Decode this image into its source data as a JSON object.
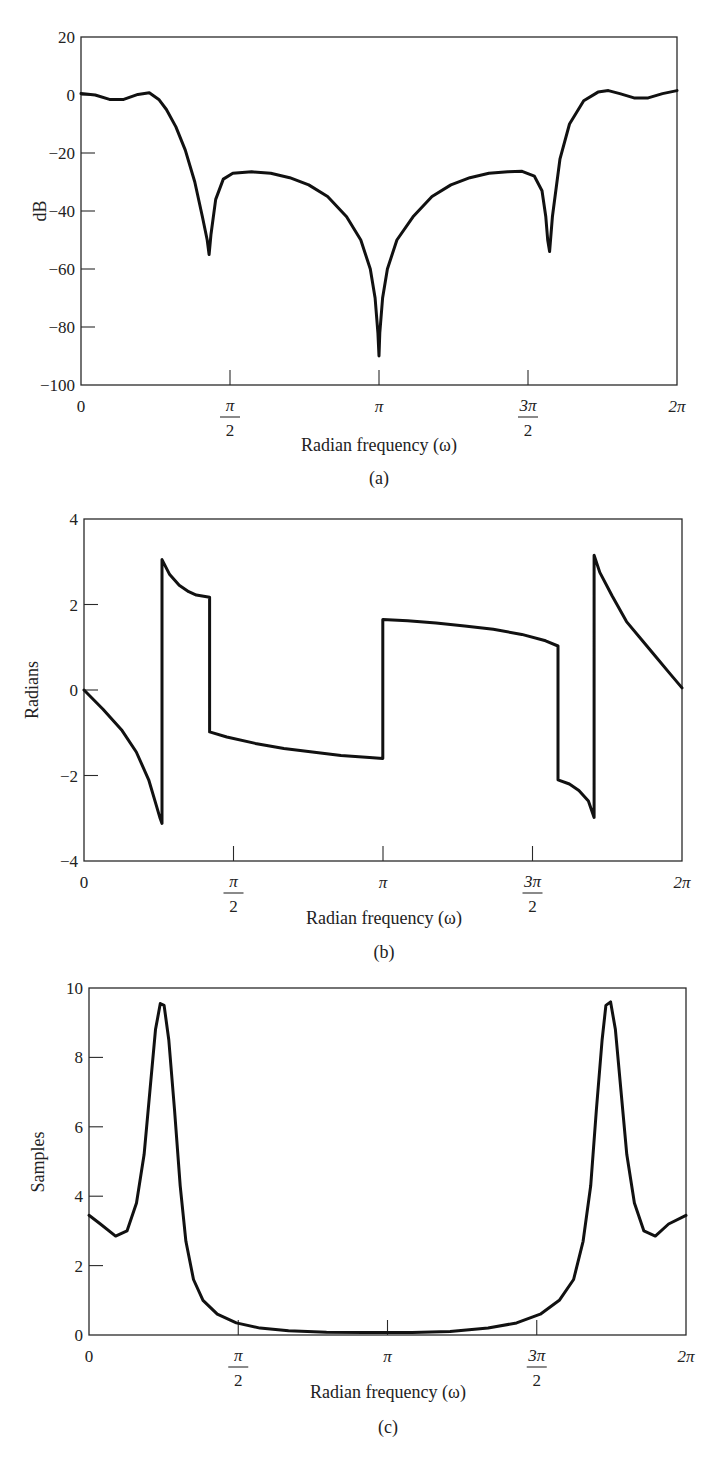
{
  "chart_data": [
    {
      "id": "a",
      "type": "line",
      "panel_label": "(a)",
      "title": "",
      "xlabel": "Radian frequency (ω)",
      "ylabel": "dB",
      "xlim": [
        0,
        6.2832
      ],
      "ylim": [
        -100,
        20
      ],
      "xticks": [
        {
          "value": 0,
          "num": "0",
          "den": ""
        },
        {
          "value": 1.5708,
          "num": "π",
          "den": "2"
        },
        {
          "value": 3.1416,
          "num": "π",
          "den": ""
        },
        {
          "value": 4.7124,
          "num": "3π",
          "den": "2"
        },
        {
          "value": 6.2832,
          "num": "2π",
          "den": ""
        }
      ],
      "yticks": [
        20,
        0,
        -20,
        -40,
        -60,
        -80,
        -100
      ],
      "grid": false,
      "series": [
        {
          "name": "magnitude",
          "x": [
            0,
            0.15,
            0.3,
            0.45,
            0.6,
            0.72,
            0.82,
            0.9,
            1.0,
            1.1,
            1.2,
            1.28,
            1.33,
            1.35,
            1.37,
            1.42,
            1.5,
            1.6,
            1.8,
            2.0,
            2.2,
            2.4,
            2.6,
            2.8,
            2.95,
            3.05,
            3.1,
            3.13,
            3.1416,
            3.15,
            3.18,
            3.23,
            3.33,
            3.5,
            3.7,
            3.9,
            4.1,
            4.3,
            4.5,
            4.65,
            4.78,
            4.86,
            4.9,
            4.92,
            4.94,
            4.97,
            5.05,
            5.15,
            5.3,
            5.45,
            5.56,
            5.68,
            5.83,
            5.98,
            6.13,
            6.2832
          ],
          "y": [
            0.5,
            0,
            -1.5,
            -1.5,
            0.2,
            0.8,
            -1.5,
            -5,
            -11,
            -19,
            -30,
            -42,
            -50,
            -55,
            -48,
            -36,
            -29,
            -27,
            -26.5,
            -27,
            -28.5,
            -31,
            -35,
            -42,
            -50,
            -60,
            -70,
            -82,
            -90,
            -82,
            -70,
            -60,
            -50,
            -42,
            -35,
            -31,
            -28.5,
            -27,
            -26.5,
            -26.3,
            -28,
            -33,
            -42,
            -50,
            -54,
            -42,
            -22,
            -10,
            -2,
            1,
            1.5,
            0.5,
            -1,
            -1,
            0.5,
            1.5
          ]
        }
      ]
    },
    {
      "id": "b",
      "type": "line",
      "panel_label": "(b)",
      "title": "",
      "xlabel": "Radian frequency (ω)",
      "ylabel": "Radians",
      "xlim": [
        0,
        6.2832
      ],
      "ylim": [
        -4,
        4
      ],
      "xticks": [
        {
          "value": 0,
          "num": "0",
          "den": ""
        },
        {
          "value": 1.5708,
          "num": "π",
          "den": "2"
        },
        {
          "value": 3.1416,
          "num": "π",
          "den": ""
        },
        {
          "value": 4.7124,
          "num": "3π",
          "den": "2"
        },
        {
          "value": 6.2832,
          "num": "2π",
          "den": ""
        }
      ],
      "yticks": [
        4,
        2,
        0,
        -2,
        -4
      ],
      "grid": false,
      "series": [
        {
          "name": "phase",
          "x": [
            0,
            0.2,
            0.4,
            0.55,
            0.68,
            0.76,
            0.8,
            0.82,
            0.82,
            0.9,
            1.0,
            1.1,
            1.18,
            1.32,
            1.32,
            1.5,
            1.8,
            2.1,
            2.4,
            2.7,
            3.0,
            3.14,
            3.14,
            3.4,
            3.7,
            4.0,
            4.3,
            4.6,
            4.85,
            4.98,
            4.98,
            5.1,
            5.2,
            5.3,
            5.36,
            5.36,
            5.42,
            5.55,
            5.7,
            5.85,
            6.0,
            6.15,
            6.2832
          ],
          "y": [
            0,
            -0.45,
            -0.95,
            -1.45,
            -2.1,
            -2.7,
            -3.0,
            -3.12,
            3.05,
            2.7,
            2.45,
            2.3,
            2.22,
            2.17,
            -0.98,
            -1.1,
            -1.25,
            -1.37,
            -1.45,
            -1.53,
            -1.58,
            -1.6,
            1.65,
            1.62,
            1.57,
            1.5,
            1.42,
            1.3,
            1.15,
            1.03,
            -2.1,
            -2.2,
            -2.35,
            -2.6,
            -2.98,
            3.15,
            2.75,
            2.2,
            1.6,
            1.2,
            0.8,
            0.4,
            0.05
          ]
        }
      ]
    },
    {
      "id": "c",
      "type": "line",
      "panel_label": "(c)",
      "title": "",
      "xlabel": "Radian frequency (ω)",
      "ylabel": "Samples",
      "xlim": [
        0,
        6.2832
      ],
      "ylim": [
        0,
        10
      ],
      "xticks": [
        {
          "value": 0,
          "num": "0",
          "den": ""
        },
        {
          "value": 1.5708,
          "num": "π",
          "den": "2"
        },
        {
          "value": 3.1416,
          "num": "π",
          "den": ""
        },
        {
          "value": 4.7124,
          "num": "3π",
          "den": "2"
        },
        {
          "value": 6.2832,
          "num": "2π",
          "den": ""
        }
      ],
      "yticks": [
        10,
        8,
        6,
        4,
        2,
        0
      ],
      "grid": false,
      "series": [
        {
          "name": "group delay",
          "x": [
            0,
            0.12,
            0.28,
            0.4,
            0.5,
            0.58,
            0.64,
            0.7,
            0.75,
            0.79,
            0.84,
            0.9,
            0.96,
            1.02,
            1.1,
            1.2,
            1.35,
            1.55,
            1.8,
            2.1,
            2.5,
            2.9,
            3.1416,
            3.4,
            3.8,
            4.2,
            4.5,
            4.75,
            4.95,
            5.1,
            5.2,
            5.28,
            5.34,
            5.4,
            5.44,
            5.49,
            5.54,
            5.6,
            5.66,
            5.74,
            5.84,
            5.96,
            6.1,
            6.2832
          ],
          "y": [
            3.45,
            3.2,
            2.85,
            3.0,
            3.8,
            5.2,
            7.0,
            8.8,
            9.55,
            9.5,
            8.5,
            6.5,
            4.3,
            2.7,
            1.6,
            1.0,
            0.6,
            0.35,
            0.2,
            0.12,
            0.08,
            0.07,
            0.07,
            0.07,
            0.1,
            0.2,
            0.35,
            0.6,
            1.0,
            1.6,
            2.7,
            4.3,
            6.5,
            8.5,
            9.5,
            9.6,
            8.8,
            7.0,
            5.2,
            3.8,
            3.0,
            2.85,
            3.2,
            3.45
          ]
        }
      ]
    }
  ],
  "panels": {
    "a": {
      "label": "(a)",
      "xlabel": "Radian frequency (ω)",
      "ylabel": "dB"
    },
    "b": {
      "label": "(b)",
      "xlabel": "Radian frequency (ω)",
      "ylabel": "Radians"
    },
    "c": {
      "label": "(c)",
      "xlabel": "Radian frequency (ω)",
      "ylabel": "Samples"
    }
  },
  "style": {
    "line_color": "#111111",
    "axis_color": "#2a2a2a",
    "background": "#ffffff"
  }
}
